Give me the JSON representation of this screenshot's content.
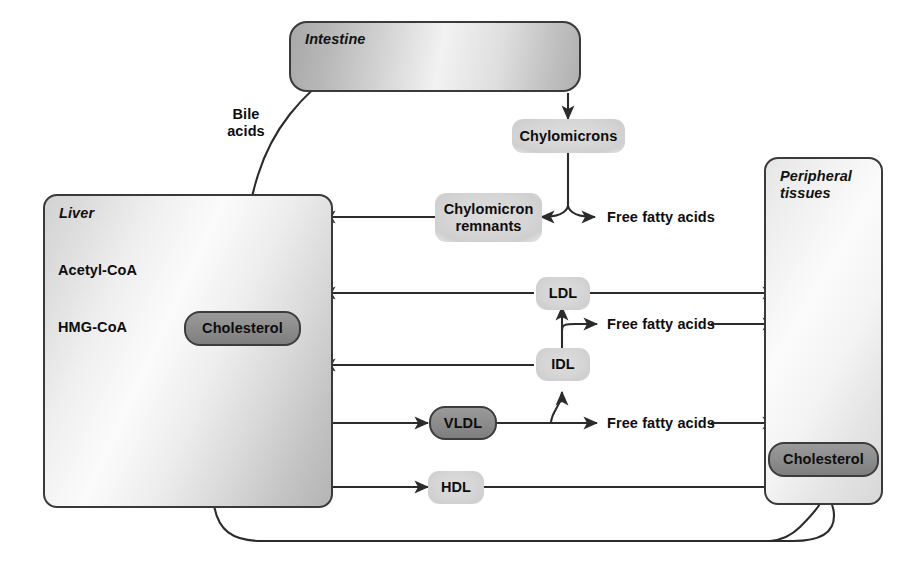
{
  "diagram": {
    "colors": {
      "stroke": "#2b2b2b",
      "node_dark": "#8e8e8e",
      "node_light": "#d5d5d5",
      "organ_border": "#3a3a3a",
      "text": "#0d0d0d"
    }
  },
  "compartments": {
    "intestine": {
      "label": "Intestine"
    },
    "liver": {
      "label": "Liver"
    },
    "peripheral": {
      "label": "Peripheral\ntissues"
    }
  },
  "nodes": {
    "chylomicrons": {
      "label": "Chylomicrons",
      "style": "light"
    },
    "chylomicron_remnants": {
      "label": "Chylomicron\nremnants",
      "style": "light"
    },
    "ldl": {
      "label": "LDL",
      "style": "light"
    },
    "idl": {
      "label": "IDL",
      "style": "light"
    },
    "vldl": {
      "label": "VLDL",
      "style": "dark"
    },
    "hdl": {
      "label": "HDL",
      "style": "light"
    },
    "liver_cholesterol": {
      "label": "Cholesterol",
      "style": "dark"
    },
    "peripheral_cholesterol": {
      "label": "Cholesterol",
      "style": "dark"
    }
  },
  "labels": {
    "bile_acids": "Bile\nacids",
    "acetyl_coa": "Acetyl-CoA",
    "hmg_coa": "HMG-CoA",
    "ffa_chylomicron": "Free fatty acids",
    "ffa_idl": "Free fatty acids",
    "ffa_vldl": "Free fatty acids"
  },
  "edges": [
    {
      "name": "intestine-to-chylomicrons",
      "from": "intestine",
      "to": "chylomicrons",
      "arrow": true
    },
    {
      "name": "chylomicrons-to-remnants",
      "from": "chylomicrons",
      "to": "chylomicron_remnants",
      "arrow": true
    },
    {
      "name": "chylomicrons-to-free-fatty-acids",
      "from": "chylomicrons",
      "to": "ffa_chylomicron",
      "arrow": true
    },
    {
      "name": "remnants-to-liver",
      "from": "chylomicron_remnants",
      "to": "liver",
      "arrow": true
    },
    {
      "name": "ldl-to-liver",
      "from": "ldl",
      "to": "liver",
      "arrow": true
    },
    {
      "name": "ldl-to-peripheral",
      "from": "ldl",
      "to": "peripheral",
      "arrow": true
    },
    {
      "name": "idl-to-ldl",
      "from": "idl",
      "to": "ldl",
      "arrow": true
    },
    {
      "name": "idl-to-liver",
      "from": "idl",
      "to": "liver",
      "arrow": true
    },
    {
      "name": "idl-free-fatty-acids-to-peripheral",
      "from": "idl",
      "to": "peripheral",
      "arrow": true
    },
    {
      "name": "liver-to-vldl",
      "from": "liver",
      "to": "vldl",
      "arrow": true
    },
    {
      "name": "vldl-to-idl",
      "from": "vldl",
      "to": "idl",
      "arrow": true
    },
    {
      "name": "vldl-free-fatty-acids-to-peripheral",
      "from": "vldl",
      "to": "peripheral",
      "arrow": true
    },
    {
      "name": "liver-to-hdl",
      "from": "liver",
      "to": "hdl",
      "arrow": true
    },
    {
      "name": "hdl-to-peripheral-cholesterol",
      "from": "hdl",
      "to": "peripheral_cholesterol",
      "arrow": false
    },
    {
      "name": "peripheral-cholesterol-to-liver-cholesterol",
      "from": "peripheral_cholesterol",
      "to": "liver_cholesterol",
      "arrow": true
    },
    {
      "name": "liver-cholesterol-to-intestine-bile-acids",
      "from": "liver_cholesterol",
      "to": "intestine",
      "arrow": true
    },
    {
      "name": "acetyl-coa-to-hmg-coa",
      "from": "acetyl_coa",
      "to": "hmg_coa",
      "arrow": true
    },
    {
      "name": "hmg-coa-to-cholesterol",
      "from": "hmg_coa",
      "to": "liver_cholesterol",
      "arrow": true
    }
  ]
}
